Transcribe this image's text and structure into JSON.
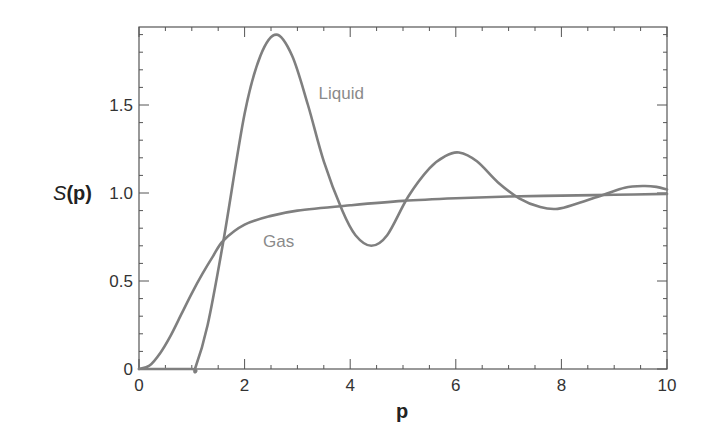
{
  "chart_data": {
    "type": "line",
    "title": "",
    "xlabel": "p",
    "ylabel": "S(p)",
    "xlim": [
      0,
      10
    ],
    "ylim": [
      0,
      1.94
    ],
    "xticks": [
      0,
      2,
      4,
      6,
      8,
      10
    ],
    "xtick_labels": [
      "0",
      "2",
      "4",
      "6",
      "8",
      "10"
    ],
    "yticks": [
      0,
      0.5,
      1.0,
      1.5
    ],
    "ytick_labels": [
      "0",
      "0.5",
      "1.0",
      "1.5"
    ],
    "grid": false,
    "legend": "inline labels",
    "series": [
      {
        "name": "Liquid",
        "color": "#7f7f7f",
        "label_pos": [
          3.4,
          1.57
        ],
        "x": [
          0,
          1.0,
          1.06,
          1.3,
          1.6,
          2.0,
          2.3,
          2.6,
          2.9,
          3.2,
          3.5,
          3.85,
          4.1,
          4.4,
          4.7,
          5.1,
          5.5,
          5.8,
          6.06,
          6.4,
          6.8,
          7.2,
          7.6,
          7.93,
          8.3,
          8.8,
          9.2,
          9.55,
          9.8,
          10.0
        ],
        "y": [
          0,
          0,
          0.0,
          0.25,
          0.73,
          1.45,
          1.78,
          1.9,
          1.78,
          1.5,
          1.18,
          0.9,
          0.76,
          0.7,
          0.76,
          0.98,
          1.14,
          1.21,
          1.23,
          1.18,
          1.06,
          0.97,
          0.92,
          0.91,
          0.94,
          0.99,
          1.03,
          1.04,
          1.035,
          1.02
        ]
      },
      {
        "name": "Gas",
        "color": "#7f7f7f",
        "label_pos": [
          2.35,
          0.73
        ],
        "x": [
          0,
          0.2,
          0.4,
          0.6,
          0.8,
          1.0,
          1.2,
          1.4,
          1.6,
          2.0,
          2.5,
          3.0,
          4.0,
          5.0,
          6.0,
          7.0,
          8.0,
          9.0,
          10.0
        ],
        "y": [
          0,
          0.02,
          0.09,
          0.19,
          0.31,
          0.43,
          0.54,
          0.64,
          0.73,
          0.82,
          0.87,
          0.9,
          0.93,
          0.955,
          0.97,
          0.98,
          0.985,
          0.99,
          0.995
        ]
      }
    ]
  }
}
